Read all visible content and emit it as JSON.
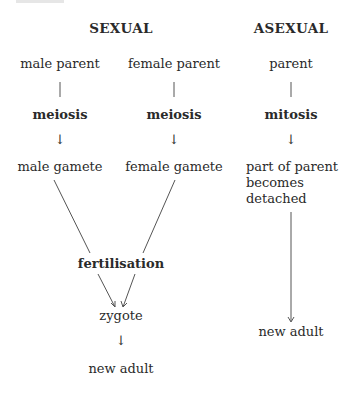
{
  "headings": {
    "sexual": "SEXUAL",
    "asexual": "ASEXUAL"
  },
  "sexual": {
    "male": {
      "parent": "male parent",
      "process": "meiosis",
      "gamete": "male gamete"
    },
    "female": {
      "parent": "female parent",
      "process": "meiosis",
      "gamete": "female gamete"
    },
    "fusion": "fertilisation",
    "zygote": "zygote",
    "result": "new adult"
  },
  "asexual": {
    "parent": "parent",
    "process": "mitosis",
    "detach_line1": "part of parent",
    "detach_line2": "becomes",
    "detach_line3": "detached",
    "result": "new adult"
  },
  "arrow_glyph": "↓"
}
